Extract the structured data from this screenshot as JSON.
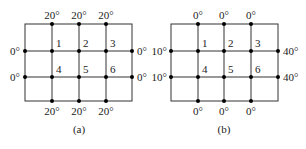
{
  "diagrams": [
    {
      "caption": "(a)",
      "top_labels": [
        "20°",
        "20°",
        "20°"
      ],
      "bottom_labels": [
        "20°",
        "20°",
        "20°"
      ],
      "left_labels": [
        "0°",
        "0°"
      ],
      "right_labels": [
        "0°",
        "0°"
      ],
      "node_labels": [
        "1",
        "2",
        "3",
        "4",
        "5",
        "6"
      ]
    },
    {
      "caption": "(b)",
      "top_labels": [
        "0°",
        "0°",
        "0°"
      ],
      "bottom_labels": [
        "0°",
        "0°",
        "0°"
      ],
      "left_labels": [
        "10°",
        "10°"
      ],
      "right_labels": [
        "40°",
        "40°"
      ],
      "node_labels": [
        "1",
        "2",
        "3",
        "4",
        "5",
        "6"
      ]
    }
  ],
  "colors": {
    "line": "#333333",
    "dot": "#000000",
    "text": "#222222"
  }
}
